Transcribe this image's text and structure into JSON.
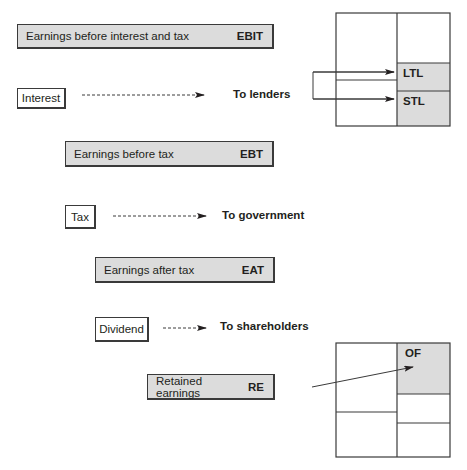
{
  "flow": {
    "ebit": {
      "label": "Earnings before interest and tax",
      "code": "EBIT"
    },
    "interest": {
      "label": "Interest",
      "destination": "To lenders"
    },
    "ebt": {
      "label": "Earnings before tax",
      "code": "EBT"
    },
    "tax": {
      "label": "Tax",
      "destination": "To government"
    },
    "eat": {
      "label": "Earnings after tax",
      "code": "EAT"
    },
    "dividend": {
      "label": "Dividend",
      "destination": "To shareholders"
    },
    "re": {
      "label": "Retained earnings",
      "code": "RE"
    }
  },
  "balance_sheet_top": {
    "cells": [
      "LTL",
      "STL"
    ]
  },
  "balance_sheet_bottom": {
    "cells": [
      "OF"
    ]
  },
  "colors": {
    "shaded": "#dcdcdc",
    "line": "#3a3a3a"
  }
}
